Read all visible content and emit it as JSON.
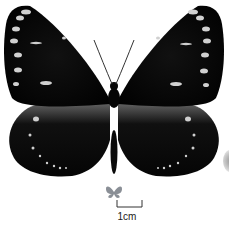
{
  "image": {
    "subject": "dark butterfly specimen, dorsal view",
    "colors": {
      "wing": "#060606",
      "spots": "#d8d8d8",
      "background": "#ffffff"
    }
  },
  "scale_bar": {
    "label": "1cm"
  },
  "size_icon": {
    "name": "butterfly-size-silhouette"
  }
}
